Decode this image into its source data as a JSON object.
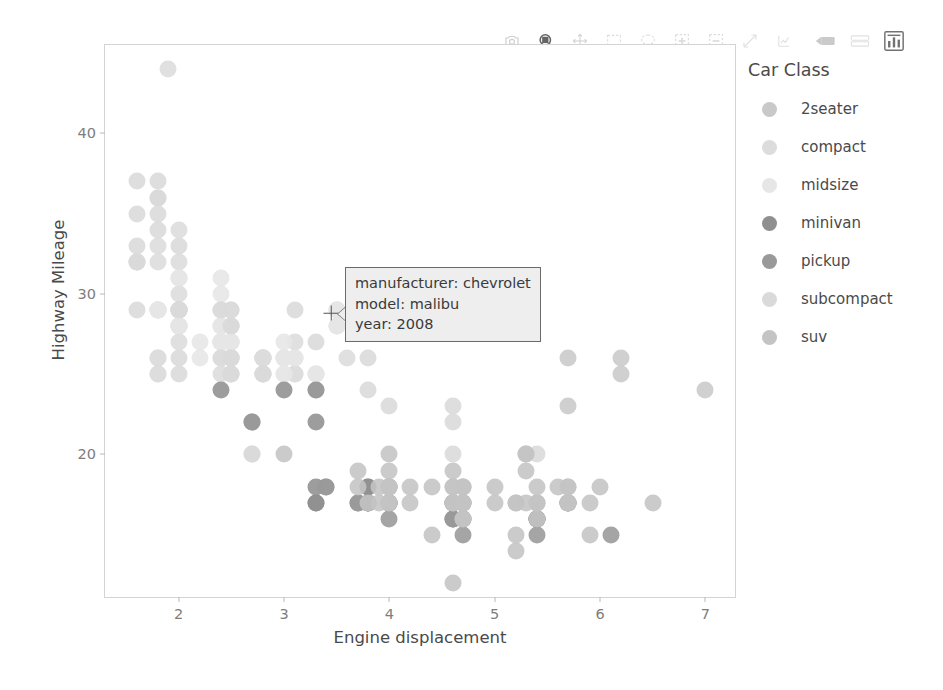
{
  "toolbar": {
    "buttons": [
      {
        "name": "download-plot-icon",
        "label": "Download plot as a png",
        "active": false
      },
      {
        "name": "zoom-box-icon",
        "label": "Zoom",
        "active": true
      },
      {
        "name": "pan-icon",
        "label": "Pan",
        "active": false
      },
      {
        "name": "box-select-icon",
        "label": "Box Select",
        "active": false
      },
      {
        "name": "lasso-select-icon",
        "label": "Lasso Select",
        "active": false
      },
      {
        "name": "zoom-in-icon",
        "label": "Zoom in",
        "active": false
      },
      {
        "name": "zoom-out-icon",
        "label": "Zoom out",
        "active": false
      },
      {
        "name": "autoscale-icon",
        "label": "Autoscale",
        "active": false
      },
      {
        "name": "reset-axes-icon",
        "label": "Reset axes",
        "active": false
      },
      {
        "name": "toggle-spike-lines-icon",
        "label": "Toggle Spike Lines",
        "active": false
      },
      {
        "name": "hover-compare-icon",
        "label": "Show closest data on hover",
        "active": false
      },
      {
        "name": "plotly-logo-icon",
        "label": "Produced with Plotly",
        "active": true
      }
    ]
  },
  "legend": {
    "title": "Car Class",
    "items": [
      {
        "label": "2seater",
        "color": "#c9c9c9"
      },
      {
        "label": "compact",
        "color": "#dcdcdc"
      },
      {
        "label": "midsize",
        "color": "#e6e6e6"
      },
      {
        "label": "minivan",
        "color": "#8f8f8f"
      },
      {
        "label": "pickup",
        "color": "#999999"
      },
      {
        "label": "subcompact",
        "color": "#dadada"
      },
      {
        "label": "suv",
        "color": "#c4c4c4"
      }
    ]
  },
  "tooltip": {
    "line1": "manufacturer: chevrolet",
    "line2": "model: malibu",
    "line3": "year: 2008"
  },
  "chart_data": {
    "type": "scatter",
    "title": "",
    "xlabel": "Engine displacement",
    "ylabel": "Highway Mileage",
    "xlim": [
      1.3,
      7.3
    ],
    "ylim": [
      11.0,
      45.5
    ],
    "xticks": [
      2,
      3,
      4,
      5,
      6,
      7
    ],
    "yticks": [
      20,
      30,
      40
    ],
    "grid": false,
    "legend_position": "right",
    "color_by": "class",
    "hover_point": {
      "x": 3.5,
      "y": 29,
      "manufacturer": "chevrolet",
      "model": "malibu",
      "year": 2008
    },
    "series": [
      {
        "name": "2seater",
        "color": "#c9c9c9",
        "points": [
          [
            5.7,
            26
          ],
          [
            5.7,
            23
          ],
          [
            6.2,
            26
          ],
          [
            6.2,
            25
          ],
          [
            7.0,
            24
          ]
        ]
      },
      {
        "name": "compact",
        "color": "#dcdcdc",
        "points": [
          [
            1.8,
            29
          ],
          [
            1.8,
            29
          ],
          [
            2.0,
            31
          ],
          [
            2.0,
            30
          ],
          [
            2.8,
            26
          ],
          [
            2.8,
            26
          ],
          [
            3.1,
            27
          ],
          [
            1.8,
            26
          ],
          [
            1.8,
            25
          ],
          [
            2.0,
            28
          ],
          [
            2.0,
            27
          ],
          [
            2.8,
            25
          ],
          [
            2.8,
            25
          ],
          [
            3.1,
            25
          ],
          [
            3.1,
            25
          ],
          [
            2.4,
            27
          ],
          [
            2.4,
            25
          ],
          [
            2.5,
            26
          ],
          [
            2.5,
            25
          ],
          [
            3.3,
            24
          ],
          [
            2.0,
            29
          ],
          [
            2.0,
            29
          ],
          [
            2.0,
            28
          ],
          [
            2.0,
            29
          ],
          [
            2.5,
            28
          ],
          [
            2.5,
            29
          ],
          [
            2.5,
            27
          ],
          [
            2.5,
            28
          ],
          [
            2.5,
            28
          ],
          [
            1.8,
            26
          ],
          [
            1.8,
            25
          ],
          [
            2.0,
            29
          ],
          [
            2.0,
            28
          ],
          [
            2.8,
            26
          ],
          [
            2.8,
            26
          ],
          [
            3.6,
            26
          ],
          [
            1.9,
            44
          ],
          [
            2.0,
            29
          ],
          [
            2.0,
            29
          ],
          [
            2.5,
            26
          ],
          [
            2.5,
            26
          ],
          [
            1.8,
            33
          ],
          [
            1.8,
            32
          ],
          [
            2.0,
            32
          ],
          [
            2.0,
            34
          ],
          [
            2.8,
            26
          ],
          [
            2.8,
            25
          ],
          [
            3.1,
            26
          ]
        ]
      },
      {
        "name": "midsize",
        "color": "#e6e6e6",
        "points": [
          [
            2.4,
            31
          ],
          [
            2.4,
            30
          ],
          [
            3.1,
            26
          ],
          [
            3.5,
            28
          ],
          [
            2.4,
            27
          ],
          [
            2.4,
            26
          ],
          [
            3.0,
            25
          ],
          [
            3.3,
            25
          ],
          [
            2.4,
            29
          ],
          [
            2.4,
            28
          ],
          [
            3.0,
            27
          ],
          [
            3.5,
            28
          ],
          [
            2.4,
            27
          ],
          [
            2.4,
            27
          ],
          [
            3.0,
            26
          ],
          [
            3.5,
            29
          ],
          [
            2.0,
            28
          ],
          [
            2.0,
            31
          ],
          [
            2.4,
            27
          ],
          [
            2.4,
            27
          ],
          [
            3.3,
            25
          ],
          [
            3.5,
            28
          ],
          [
            2.5,
            27
          ],
          [
            2.5,
            27
          ],
          [
            3.0,
            26
          ],
          [
            3.3,
            24
          ],
          [
            2.4,
            29
          ],
          [
            2.4,
            28
          ],
          [
            3.0,
            26
          ],
          [
            3.3,
            25
          ],
          [
            1.8,
            29
          ],
          [
            1.8,
            29
          ],
          [
            2.5,
            27
          ],
          [
            2.5,
            26
          ],
          [
            3.5,
            29
          ],
          [
            3.5,
            29
          ],
          [
            2.2,
            26
          ],
          [
            2.2,
            27
          ],
          [
            2.4,
            27
          ],
          [
            2.4,
            28
          ],
          [
            3.0,
            26
          ],
          [
            3.0,
            25
          ]
        ]
      },
      {
        "name": "minivan",
        "color": "#8f8f8f",
        "points": [
          [
            2.4,
            24
          ],
          [
            3.0,
            24
          ],
          [
            3.3,
            24
          ],
          [
            3.3,
            22
          ],
          [
            3.8,
            18
          ],
          [
            3.8,
            18
          ],
          [
            3.8,
            17
          ],
          [
            4.0,
            17
          ],
          [
            3.3,
            17
          ],
          [
            3.3,
            18
          ],
          [
            3.8,
            17
          ],
          [
            3.8,
            17
          ],
          [
            3.3,
            17
          ]
        ]
      },
      {
        "name": "pickup",
        "color": "#999999",
        "points": [
          [
            2.7,
            22
          ],
          [
            2.7,
            22
          ],
          [
            3.4,
            18
          ],
          [
            3.4,
            18
          ],
          [
            4.0,
            17
          ],
          [
            4.7,
            17
          ],
          [
            4.7,
            16
          ],
          [
            4.7,
            17
          ],
          [
            5.7,
            17
          ],
          [
            3.7,
            17
          ],
          [
            3.7,
            17
          ],
          [
            4.0,
            17
          ],
          [
            4.0,
            16
          ],
          [
            4.0,
            17
          ],
          [
            4.6,
            16
          ],
          [
            4.6,
            16
          ],
          [
            4.6,
            17
          ],
          [
            5.4,
            16
          ],
          [
            5.4,
            15
          ],
          [
            4.0,
            18
          ],
          [
            4.0,
            18
          ],
          [
            4.6,
            17
          ],
          [
            4.6,
            17
          ],
          [
            4.6,
            16
          ],
          [
            5.4,
            16
          ],
          [
            5.4,
            16
          ],
          [
            5.4,
            16
          ],
          [
            4.7,
            15
          ],
          [
            4.7,
            16
          ],
          [
            5.7,
            17
          ],
          [
            5.7,
            17
          ],
          [
            6.1,
            15
          ]
        ]
      },
      {
        "name": "subcompact",
        "color": "#dadada",
        "points": [
          [
            1.6,
            33
          ],
          [
            1.6,
            32
          ],
          [
            1.6,
            32
          ],
          [
            1.6,
            29
          ],
          [
            1.6,
            32
          ],
          [
            1.8,
            34
          ],
          [
            1.8,
            36
          ],
          [
            1.8,
            36
          ],
          [
            2.0,
            29
          ],
          [
            2.4,
            26
          ],
          [
            1.6,
            37
          ],
          [
            1.6,
            35
          ],
          [
            1.8,
            37
          ],
          [
            1.8,
            35
          ],
          [
            2.0,
            33
          ],
          [
            2.4,
            29
          ],
          [
            2.5,
            28
          ],
          [
            2.5,
            29
          ],
          [
            3.3,
            27
          ],
          [
            2.0,
            26
          ],
          [
            2.0,
            25
          ],
          [
            2.5,
            26
          ],
          [
            2.5,
            25
          ],
          [
            2.8,
            25
          ],
          [
            3.1,
            29
          ],
          [
            3.8,
            26
          ],
          [
            4.6,
            23
          ],
          [
            5.4,
            20
          ],
          [
            2.5,
            25
          ],
          [
            2.5,
            26
          ],
          [
            2.7,
            20
          ],
          [
            2.7,
            20
          ],
          [
            3.8,
            24
          ],
          [
            4.0,
            23
          ],
          [
            4.6,
            22
          ],
          [
            4.6,
            20
          ]
        ]
      },
      {
        "name": "suv",
        "color": "#c4c4c4",
        "points": [
          [
            4.0,
            17
          ],
          [
            4.2,
            17
          ],
          [
            4.4,
            15
          ],
          [
            4.6,
            17
          ],
          [
            5.4,
            17
          ],
          [
            5.4,
            17
          ],
          [
            4.0,
            17
          ],
          [
            4.0,
            18
          ],
          [
            4.0,
            18
          ],
          [
            4.6,
            18
          ],
          [
            5.0,
            17
          ],
          [
            5.2,
            14
          ],
          [
            5.7,
            17
          ],
          [
            5.9,
            15
          ],
          [
            4.7,
            16
          ],
          [
            4.7,
            16
          ],
          [
            4.7,
            17
          ],
          [
            5.2,
            15
          ],
          [
            5.7,
            17
          ],
          [
            5.9,
            17
          ],
          [
            4.6,
            17
          ],
          [
            5.4,
            17
          ],
          [
            5.4,
            18
          ],
          [
            4.0,
            18
          ],
          [
            4.0,
            20
          ],
          [
            4.0,
            19
          ],
          [
            4.6,
            19
          ],
          [
            5.0,
            18
          ],
          [
            4.2,
            18
          ],
          [
            4.4,
            18
          ],
          [
            4.6,
            18
          ],
          [
            5.4,
            16
          ],
          [
            3.7,
            18
          ],
          [
            3.7,
            19
          ],
          [
            3.9,
            17
          ],
          [
            3.9,
            18
          ],
          [
            4.7,
            18
          ],
          [
            4.7,
            18
          ],
          [
            4.7,
            18
          ],
          [
            5.2,
            17
          ],
          [
            5.7,
            18
          ],
          [
            6.5,
            17
          ],
          [
            5.3,
            20
          ],
          [
            5.3,
            20
          ],
          [
            5.3,
            19
          ],
          [
            5.7,
            18
          ],
          [
            6.0,
            18
          ],
          [
            5.6,
            18
          ],
          [
            3.8,
            17
          ],
          [
            5.3,
            17
          ],
          [
            4.7,
            17
          ],
          [
            5.2,
            17
          ],
          [
            3.0,
            20
          ],
          [
            4.6,
            12
          ]
        ]
      }
    ]
  }
}
